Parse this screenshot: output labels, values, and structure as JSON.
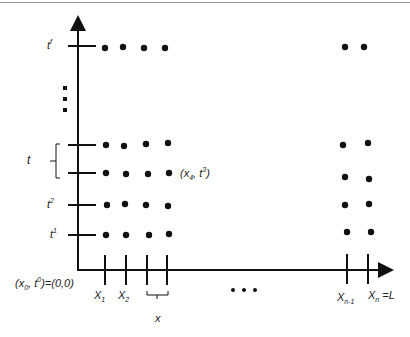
{
  "diagram": {
    "type": "space-time discretization grid",
    "axes": {
      "origin_label": {
        "base": "(x",
        "sub0": "0",
        "mid": ", t",
        "sup0": "0",
        "end": ")=(0,0)"
      },
      "x_axis": {
        "direction": "right",
        "arrow": true
      },
      "t_axis": {
        "direction": "up",
        "arrow": true
      }
    },
    "t_ticks": [
      {
        "id": "tf",
        "base": "t",
        "sup": "f"
      },
      {
        "id": "t4",
        "base": "",
        "sup": ""
      },
      {
        "id": "t3",
        "base": "",
        "sup": ""
      },
      {
        "id": "t2",
        "base": "t",
        "sup": "2"
      },
      {
        "id": "t1",
        "base": "t",
        "sup": "1"
      }
    ],
    "t_step_label": "t",
    "x_ticks": [
      {
        "id": "X1",
        "base": "X",
        "sub": "1",
        "suffix": ""
      },
      {
        "id": "X2",
        "base": "X",
        "sub": "2",
        "suffix": ""
      },
      {
        "id": "X3",
        "base": "",
        "sub": "",
        "suffix": ""
      },
      {
        "id": "X4",
        "base": "",
        "sub": "",
        "suffix": ""
      },
      {
        "id": "Xn-1",
        "base": "X",
        "sub": "n-1",
        "suffix": ""
      },
      {
        "id": "Xn",
        "base": "X",
        "sub": "n",
        "suffix": " =L"
      }
    ],
    "x_step_label": "x",
    "point_annotation": {
      "base": "(x",
      "sub": "4",
      "mid": ", t",
      "sup": "3",
      "end": ")"
    },
    "ellipsis_vertical": "⋮",
    "ellipsis_horizontal": "• • •",
    "colors": {
      "ink": "#111111",
      "border": "#9a9a9a",
      "background": "#ffffff"
    }
  }
}
